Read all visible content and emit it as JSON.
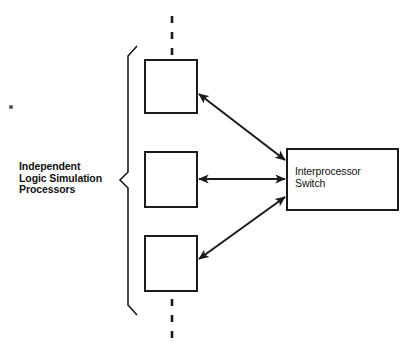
{
  "diagram": {
    "background_color": "#ffffff",
    "line_color": "#1a1a1a",
    "group_label": "Independent\nLogic Simulation\nProcessors",
    "processor_nodes": [
      {
        "id": "processor-top",
        "label": ""
      },
      {
        "id": "processor-middle",
        "label": ""
      },
      {
        "id": "processor-bottom",
        "label": ""
      }
    ],
    "switch_node": {
      "id": "interprocessor-switch",
      "label": "Interprocessor\nSwitch"
    },
    "connections": [
      {
        "from": "processor-top",
        "to": "interprocessor-switch",
        "style": "double-arrow-diagonal"
      },
      {
        "from": "processor-middle",
        "to": "interprocessor-switch",
        "style": "double-arrow-horizontal"
      },
      {
        "from": "processor-bottom",
        "to": "interprocessor-switch",
        "style": "double-arrow-diagonal"
      }
    ],
    "boundary_markers": [
      {
        "id": "dashed-line-top",
        "style": "vertical-dashed"
      },
      {
        "id": "dashed-line-bottom",
        "style": "vertical-dashed"
      }
    ]
  }
}
